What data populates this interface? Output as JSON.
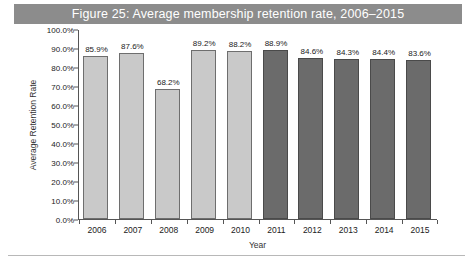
{
  "figure": {
    "title": "Figure 25: Average membership retention rate, 2006–2015",
    "title_bar_color": "#8c8c8c",
    "title_text_color": "#ffffff"
  },
  "chart_data": {
    "type": "bar",
    "title": "Figure 25: Average membership retention rate, 2006–2015",
    "xlabel": "Year",
    "ylabel": "Average Retention Rate",
    "categories": [
      "2006",
      "2007",
      "2008",
      "2009",
      "2010",
      "2011",
      "2012",
      "2013",
      "2014",
      "2015"
    ],
    "values": [
      85.9,
      87.6,
      68.2,
      89.2,
      88.2,
      88.9,
      84.6,
      84.3,
      84.4,
      83.6
    ],
    "data_labels": [
      "85.9%",
      "87.6%",
      "68.2%",
      "89.2%",
      "88.2%",
      "88.9%",
      "84.6%",
      "84.3%",
      "84.4%",
      "83.6%"
    ],
    "ylim": [
      0,
      100
    ],
    "ytick_values": [
      0,
      10,
      20,
      30,
      40,
      50,
      60,
      70,
      80,
      90,
      100
    ],
    "ytick_labels": [
      "0.0%",
      "10.0%",
      "20.0%",
      "30.0%",
      "40.0%",
      "50.0%",
      "60.0%",
      "70.0%",
      "80.0%",
      "90.0%",
      "100.0%"
    ],
    "grid": false,
    "legend": false,
    "bar_colors": [
      "#c9c9c9",
      "#c9c9c9",
      "#c9c9c9",
      "#c9c9c9",
      "#c9c9c9",
      "#6b6b6b",
      "#6b6b6b",
      "#6b6b6b",
      "#6b6b6b",
      "#6b6b6b"
    ],
    "series": [
      {
        "name": "Average Retention Rate",
        "values": [
          85.9,
          87.6,
          68.2,
          89.2,
          88.2,
          88.9,
          84.6,
          84.3,
          84.4,
          83.6
        ]
      }
    ]
  }
}
